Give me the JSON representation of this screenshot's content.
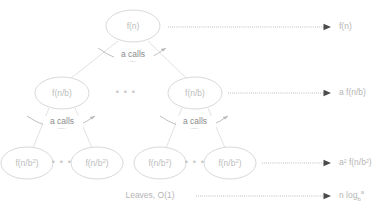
{
  "diagram": {
    "colors": {
      "node_stroke": "#d9d9d9",
      "node_text": "#bdbdbd",
      "edge": "#e2e2e2",
      "arc": "#b8b8b8",
      "calls_text": "#8c8c8c",
      "dotted": "#9a9a9a",
      "arrow_head": "#4a4a4a",
      "right_label_text": "#b5b5b5",
      "background": "#ffffff"
    },
    "levels": [
      {
        "name": "root-level",
        "nodes": [
          {
            "id": "root",
            "label": "f(n)",
            "cx": 133,
            "cy": 26,
            "rx": 27,
            "ry": 16
          }
        ],
        "right_label": {
          "text": "f(n)",
          "base": "f(n)",
          "x": 339,
          "y": 26
        },
        "arrow": {
          "x1": 168,
          "x2": 334,
          "y": 27
        }
      },
      {
        "name": "second-level",
        "nodes": [
          {
            "id": "left-child",
            "label": "f(n/b)",
            "cx": 62,
            "cy": 93,
            "rx": 27,
            "ry": 16
          },
          {
            "id": "right-child",
            "label": "f(n/b)",
            "cx": 195,
            "cy": 93,
            "rx": 27,
            "ry": 16
          }
        ],
        "ellipsis": {
          "text": "• • •",
          "x": 126,
          "y": 93
        },
        "right_label": {
          "text": "a f(n/b)",
          "x": 339,
          "y": 93
        },
        "arrow": {
          "x1": 228,
          "x2": 334,
          "y": 93
        }
      },
      {
        "name": "third-level",
        "nodes": [
          {
            "id": "leaf-1",
            "label": "f(n/b",
            "sup": "2",
            "tail": ")",
            "cx": 27,
            "cy": 163,
            "rx": 26,
            "ry": 16
          },
          {
            "id": "leaf-2",
            "label": "f(n/b",
            "sup": "2",
            "tail": ")",
            "cx": 97,
            "cy": 163,
            "rx": 26,
            "ry": 16
          },
          {
            "id": "leaf-3",
            "label": "f(n/b",
            "sup": "2",
            "tail": ")",
            "cx": 160,
            "cy": 163,
            "rx": 26,
            "ry": 16
          },
          {
            "id": "leaf-4",
            "label": "f(n/b",
            "sup": "2",
            "tail": ")",
            "cx": 230,
            "cy": 163,
            "rx": 26,
            "ry": 16
          }
        ],
        "ellipses": [
          {
            "text": "• • •",
            "x": 62,
            "y": 163
          },
          {
            "text": "• • •",
            "x": 195,
            "y": 163
          }
        ],
        "right_label": {
          "text": "a² f(n/b²)",
          "x": 339,
          "y": 163
        },
        "arrow": {
          "x1": 262,
          "x2": 334,
          "y": 163
        }
      },
      {
        "name": "leaves-level",
        "leaves_text": "Leaves, O(1)",
        "leaves_x": 150,
        "leaves_y": 196,
        "right_label": {
          "text": "n log",
          "sub": "b",
          "sup": "a",
          "x": 339,
          "y": 196
        },
        "arrow": {
          "x1": 196,
          "x2": 334,
          "y": 196
        }
      }
    ],
    "call_arcs": [
      {
        "id": "arc-root",
        "text": "a calls",
        "label_x": 133,
        "label_y": 55,
        "path": "M 98,48 Q 133,74 168,48",
        "head_x": 168,
        "head_y": 48
      },
      {
        "id": "arc-left",
        "text": "a calls",
        "label_x": 62,
        "label_y": 122,
        "path": "M 27,116 Q 62,140 97,116",
        "head_x": 97,
        "head_y": 116
      },
      {
        "id": "arc-right",
        "text": "a calls",
        "label_x": 195,
        "label_y": 122,
        "path": "M 160,116 Q 195,140 230,116",
        "head_x": 230,
        "head_y": 116
      }
    ],
    "edges": [
      {
        "id": "edge-root-left",
        "x1": 118,
        "y1": 41,
        "x2": 72,
        "y2": 78
      },
      {
        "id": "edge-root-right",
        "x1": 148,
        "y1": 41,
        "x2": 186,
        "y2": 78
      },
      {
        "id": "edge-left-leaf1",
        "x1": 50,
        "y1": 108,
        "x2": 33,
        "y2": 148
      },
      {
        "id": "edge-left-leaf2",
        "x1": 74,
        "y1": 108,
        "x2": 92,
        "y2": 148
      },
      {
        "id": "edge-right-leaf3",
        "x1": 183,
        "y1": 108,
        "x2": 166,
        "y2": 148
      },
      {
        "id": "edge-right-leaf4",
        "x1": 207,
        "y1": 108,
        "x2": 225,
        "y2": 148
      }
    ]
  }
}
